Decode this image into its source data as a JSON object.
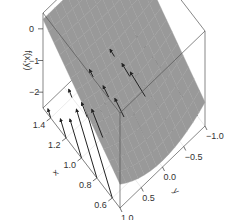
{
  "chart_data": {
    "type": "surface",
    "title": "",
    "subtitle": "",
    "xlabel": "x",
    "ylabel": "y",
    "zlabel": "f(x,y)",
    "xlim": [
      0.5,
      1.5
    ],
    "ylim": [
      -1.0,
      1.0
    ],
    "zlim": [
      -2.5,
      0.5
    ],
    "x_ticks": [
      0.6,
      0.8,
      1.0,
      1.2,
      1.4
    ],
    "x_tick_labels": [
      "0.6",
      "0.8",
      "1.0",
      "1.2",
      "1.4"
    ],
    "y_ticks": [
      -1.0,
      -0.5,
      0.0,
      0.5,
      1.0
    ],
    "y_tick_labels": [
      "-1.0",
      "-0.5",
      "0.0",
      "0.5",
      "1.0"
    ],
    "z_ticks": [
      0,
      -1,
      -2
    ],
    "z_tick_labels": [
      "0",
      "-1",
      "-2"
    ],
    "surface": {
      "description": "saddle-like gray surface, higher at y corners",
      "color": "#999999",
      "grid_x": [
        0.5,
        0.75,
        1.0,
        1.25,
        1.5
      ],
      "grid_y": [
        -1.0,
        -0.5,
        0.0,
        0.5,
        1.0
      ]
    },
    "vector_field": {
      "description": "gradient arrows drawn on the floor plane",
      "color": "#222222",
      "x": [
        0.6,
        0.8,
        1.0,
        1.2,
        1.4
      ],
      "y": [
        -1.0,
        -0.5,
        0.0,
        0.5,
        1.0
      ]
    },
    "grid": true,
    "legend": "none",
    "box": true
  }
}
